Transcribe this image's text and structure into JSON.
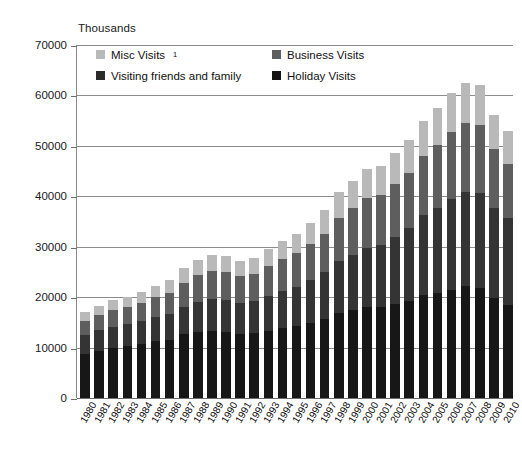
{
  "chart_data": {
    "type": "bar",
    "stacked": true,
    "title": "",
    "subtitle": "",
    "xlabel": "",
    "ylabel": "Thousands",
    "unit_label": "Thousands",
    "ylim": [
      0,
      70000
    ],
    "ytick_step": 10000,
    "ytick_labels": [
      "0",
      "10000",
      "20000",
      "30000",
      "40000",
      "50000",
      "60000",
      "70000"
    ],
    "ytick_values": [
      0,
      10000,
      20000,
      30000,
      40000,
      50000,
      60000,
      70000
    ],
    "grid": true,
    "grid_axis": "y",
    "legend_position": "top-inside",
    "categories": [
      "1980",
      "1981",
      "1982",
      "1983",
      "1984",
      "1985",
      "1986",
      "1987",
      "1988",
      "1989",
      "1990",
      "1991",
      "1992",
      "1993",
      "1994",
      "1995",
      "1996",
      "1997",
      "1998",
      "1999",
      "2000",
      "2001",
      "2002",
      "2003",
      "2004",
      "2005",
      "2006",
      "2007",
      "2008",
      "2009",
      "2010"
    ],
    "series": [
      {
        "name": "Holiday Visits",
        "color": "#171717",
        "values": [
          8700,
          9400,
          9900,
          10300,
          10700,
          11300,
          11600,
          12600,
          13100,
          13300,
          13000,
          12700,
          12800,
          13300,
          13800,
          14200,
          14900,
          15600,
          16800,
          17400,
          18000,
          18100,
          18700,
          19300,
          20500,
          20900,
          21500,
          22200,
          21800,
          19800,
          18500
        ]
      },
      {
        "name": "Visiting friends and family",
        "color": "#343434",
        "values": [
          3700,
          4000,
          4200,
          4300,
          4500,
          4700,
          5000,
          5500,
          6000,
          6300,
          6400,
          6200,
          6400,
          6900,
          7400,
          7800,
          8500,
          9300,
          10300,
          11000,
          11800,
          12300,
          13300,
          14400,
          15700,
          16800,
          17900,
          18700,
          18900,
          17900,
          17200
        ]
      },
      {
        "name": "Business Visits",
        "color": "#5e5e5e",
        "values": [
          2900,
          3100,
          3400,
          3500,
          3700,
          4000,
          4300,
          4800,
          5200,
          5500,
          5500,
          5200,
          5400,
          5900,
          6300,
          6700,
          7100,
          7700,
          8600,
          9200,
          9900,
          9900,
          10500,
          11000,
          11800,
          12500,
          13300,
          13600,
          13400,
          11600,
          10800
        ]
      },
      {
        "name": "Misc Visits",
        "color": "#b9b9b9",
        "values": [
          1700,
          1800,
          1900,
          2000,
          2100,
          2300,
          2500,
          2800,
          3100,
          3300,
          3300,
          3100,
          3200,
          3500,
          3700,
          3900,
          4200,
          4600,
          5100,
          5400,
          5800,
          5800,
          6100,
          6500,
          7000,
          7400,
          7800,
          8000,
          7900,
          6900,
          6500
        ]
      }
    ],
    "totals": [
      17000,
      18300,
      19400,
      20100,
      21000,
      22300,
      23400,
      25700,
      27400,
      28400,
      28200,
      27200,
      27800,
      29600,
      31200,
      32600,
      34700,
      37200,
      40800,
      43000,
      45500,
      46100,
      48600,
      51200,
      55000,
      57600,
      60500,
      62500,
      62000,
      56200,
      53000
    ],
    "legend_entries": [
      {
        "label": "Misc Visits",
        "superscript": "1",
        "color": "#b9b9b9",
        "swatch_class": "sw-misc"
      },
      {
        "label": "Business Visits",
        "superscript": "",
        "color": "#5e5e5e",
        "swatch_class": "sw-business"
      },
      {
        "label": "Visiting friends and family",
        "superscript": "",
        "color": "#2b2b2b",
        "swatch_class": "sw-vfr"
      },
      {
        "label": "Holiday Visits",
        "superscript": "",
        "color": "#141414",
        "swatch_class": "sw-holiday"
      }
    ]
  }
}
